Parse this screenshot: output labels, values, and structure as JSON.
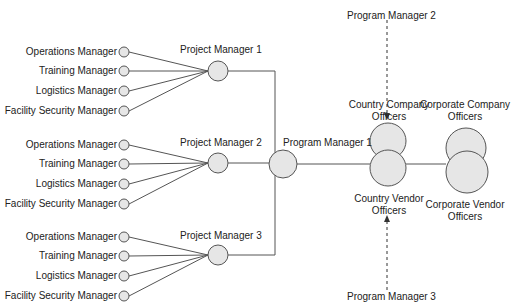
{
  "groups": [
    {
      "project_manager": "Project Manager 1",
      "members": [
        "Operations Manager",
        "Training Manager",
        "Logistics Manager",
        "Facility Security Manager"
      ]
    },
    {
      "project_manager": "Project Manager 2",
      "members": [
        "Operations Manager",
        "Training Manager",
        "Logistics Manager",
        "Facility Security Manager"
      ]
    },
    {
      "project_manager": "Project Manager 3",
      "members": [
        "Operations Manager",
        "Training Manager",
        "Logistics Manager",
        "Facility Security Manager"
      ]
    }
  ],
  "program_manager_1": "Program Manager 1",
  "program_manager_2": "Program Manager 2",
  "program_manager_3": "Program Manager 3",
  "country_company": [
    "Country Company",
    "Officers"
  ],
  "country_vendor": [
    "Country Vendor",
    "Officers"
  ],
  "corporate_company": [
    "Corporate Company",
    "Officers"
  ],
  "corporate_vendor": [
    "Corporate Vendor",
    "Officers"
  ],
  "colors": {
    "node_fill": "#e6e6e6",
    "stroke": "#555555",
    "text": "#222222"
  }
}
